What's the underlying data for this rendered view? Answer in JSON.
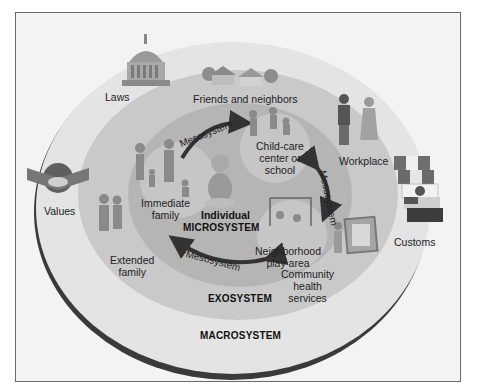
{
  "diagram": {
    "type": "concentric ecological systems model",
    "colors": {
      "background": "#f3f3f3",
      "macrosystem": "#e6e6e6",
      "macrosystem_rim": "#3a3a3a",
      "exosystem": "#c9c9c9",
      "microsystem_ring": "#b3b3b3",
      "settings": "#c4c4c4",
      "arrow": "#333333"
    },
    "systems": {
      "individual": "Individual",
      "microsystem": "MICROSYSTEM",
      "exosystem": "EXOSYSTEM",
      "macrosystem": "MACROSYSTEM"
    },
    "mesosystem_arrows": [
      {
        "label": "Mesosystem",
        "from": "Immediate family",
        "to": "Child-care center or school"
      },
      {
        "label": "Mesosystem",
        "from": "Child-care center or school",
        "to": "Neighborhood play area"
      },
      {
        "label": "Mesosystem",
        "from": "Neighborhood play area",
        "to": "Immediate family"
      }
    ],
    "microsystem_settings": {
      "family": [
        "Immediate",
        "family"
      ],
      "school": [
        "Child-care",
        "center or",
        "school"
      ],
      "play": [
        "Neighborhood",
        "play area"
      ]
    },
    "exosystem_items": {
      "friends": "Friends and neighbors",
      "workplace": "Workplace",
      "extended": [
        "Extended",
        "family"
      ],
      "health": [
        "Community",
        "health",
        "services"
      ]
    },
    "macrosystem_items": {
      "laws": "Laws",
      "values": "Values",
      "customs": "Customs"
    }
  }
}
